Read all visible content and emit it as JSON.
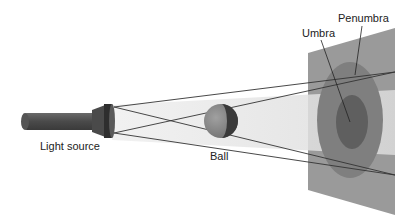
{
  "diagram": {
    "labels": {
      "light_source": "Light source",
      "ball": "Ball",
      "umbra": "Umbra",
      "penumbra": "Penumbra"
    },
    "colors": {
      "background": "#ffffff",
      "flashlight": "#555555",
      "beam": "#e6e6e6",
      "ball_lit": "#8a8a8a",
      "ball_dark": "#3a3a3a",
      "screen": "#9a9a9a",
      "penumbra": "#7e7e7e",
      "umbra": "#5e5e5e",
      "lines": "#333333"
    }
  }
}
